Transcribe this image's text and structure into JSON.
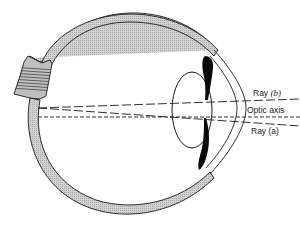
{
  "diagram": {
    "labels": {
      "ray_b": {
        "prefix": "Ray ",
        "tag": "(b)"
      },
      "optic_axis": "Optic axis",
      "ray_a": {
        "prefix": "Ray ",
        "tag": "(a)"
      }
    },
    "parts": [
      "sclera",
      "optic-nerve",
      "cornea",
      "lens",
      "iris",
      "ray-b",
      "optic-axis",
      "ray-a"
    ],
    "colors": {
      "outline": "#1a1a1a",
      "sclera_fill": "#c8c8c8",
      "iris_fill": "#0a0a0a",
      "background": "#ffffff"
    }
  }
}
